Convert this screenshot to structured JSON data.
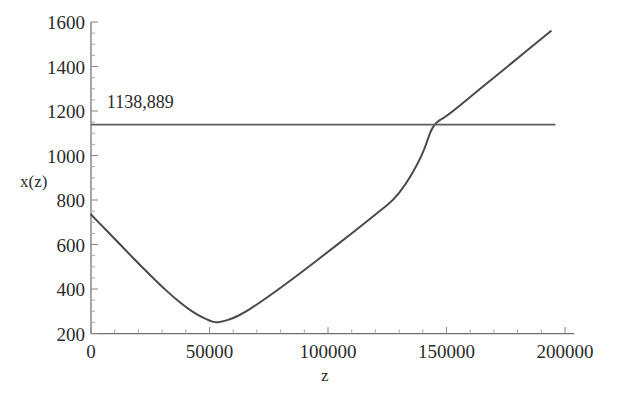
{
  "chart_data": {
    "type": "line",
    "title": "",
    "subtitle": "",
    "xlabel": "z",
    "ylabel": "x(z)",
    "xlim": [
      0,
      200000
    ],
    "ylim": [
      200,
      1600
    ],
    "grid": false,
    "legend": "none",
    "x_ticks": [
      {
        "value": 0,
        "label": "0"
      },
      {
        "value": 50000,
        "label": "50000"
      },
      {
        "value": 100000,
        "label": "100000"
      },
      {
        "value": 150000,
        "label": "150000"
      },
      {
        "value": 200000,
        "label": "200000"
      }
    ],
    "y_ticks": [
      {
        "value": 200,
        "label": "200"
      },
      {
        "value": 400,
        "label": "400"
      },
      {
        "value": 600,
        "label": "600"
      },
      {
        "value": 800,
        "label": "800"
      },
      {
        "value": 1000,
        "label": "1000"
      },
      {
        "value": 1200,
        "label": "1200"
      },
      {
        "value": 1400,
        "label": "1400"
      },
      {
        "value": 1600,
        "label": "1600"
      }
    ],
    "series": [
      {
        "name": "x(z)",
        "type": "line",
        "color": "#4a4a4a",
        "points": [
          [
            0,
            735
          ],
          [
            5000,
            680
          ],
          [
            10000,
            625
          ],
          [
            15000,
            570
          ],
          [
            20000,
            515
          ],
          [
            25000,
            462
          ],
          [
            30000,
            410
          ],
          [
            35000,
            362
          ],
          [
            40000,
            318
          ],
          [
            45000,
            283
          ],
          [
            50000,
            257
          ],
          [
            52500,
            250
          ],
          [
            55000,
            252
          ],
          [
            60000,
            268
          ],
          [
            65000,
            296
          ],
          [
            70000,
            330
          ],
          [
            80000,
            405
          ],
          [
            90000,
            485
          ],
          [
            100000,
            567
          ],
          [
            110000,
            650
          ],
          [
            120000,
            735
          ],
          [
            130000,
            820
          ],
          [
            140000,
            1000
          ],
          [
            144000,
            1139
          ],
          [
            150000,
            1176
          ],
          [
            160000,
            1263
          ],
          [
            170000,
            1350
          ],
          [
            180000,
            1437
          ],
          [
            190000,
            1524
          ],
          [
            194000,
            1559
          ]
        ]
      },
      {
        "name": "reference-line",
        "type": "hline",
        "color": "#5d5d5d",
        "y_value": 1138.889,
        "x_from": 0,
        "x_to": 196000
      }
    ],
    "annotations": [
      {
        "name": "reference-value-label",
        "text": "1138,889",
        "x": 5000,
        "y": 1215
      }
    ],
    "crossing_point": {
      "x": 144000,
      "y": 1138.889
    },
    "minimum_point": {
      "x": 52500,
      "y": 250
    }
  },
  "labels": {
    "y_axis_title": "x(z)",
    "x_axis_title": "z",
    "reference_value": "1138,889"
  },
  "colors": {
    "background": "#ffffff",
    "curve": "#4a4a4a",
    "reference_line": "#5d5d5d",
    "axis": "#6f6f6f",
    "text": "#2b2b2b"
  }
}
